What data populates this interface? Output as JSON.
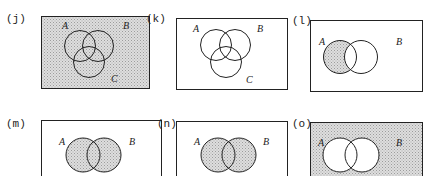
{
  "figure": {
    "panels": [
      {
        "id": "j",
        "label": "(j)",
        "sets": [
          "A",
          "B",
          "C"
        ],
        "shaded_region": "universe",
        "labels": {
          "A": "A",
          "B": "B",
          "C": "C"
        }
      },
      {
        "id": "k",
        "label": "(k)",
        "sets": [
          "A",
          "B",
          "C"
        ],
        "shaded_region": "none",
        "labels": {
          "A": "A",
          "B": "B",
          "C": "C"
        }
      },
      {
        "id": "l",
        "label": "(l)",
        "sets": [
          "A",
          "B"
        ],
        "shaded_region": "A minus B",
        "labels": {
          "A": "A",
          "B": "B"
        }
      },
      {
        "id": "m",
        "label": "(m)",
        "sets": [
          "A",
          "B"
        ],
        "shaded_region": "A union B",
        "labels": {
          "A": "A",
          "B": "B"
        }
      },
      {
        "id": "n",
        "label": "(n)",
        "sets": [
          "A",
          "B"
        ],
        "shaded_region": "A union B",
        "labels": {
          "A": "A",
          "B": "B"
        }
      },
      {
        "id": "o",
        "label": "(o)",
        "sets": [
          "A",
          "B"
        ],
        "shaded_region": "complement of A union B",
        "labels": {
          "A": "A",
          "B": "B"
        }
      }
    ],
    "colors": {
      "stroke": "#222222",
      "shade_fill": "#d4d4d4",
      "shade_dot": "#9a9a9a",
      "background": "#ffffff"
    }
  }
}
